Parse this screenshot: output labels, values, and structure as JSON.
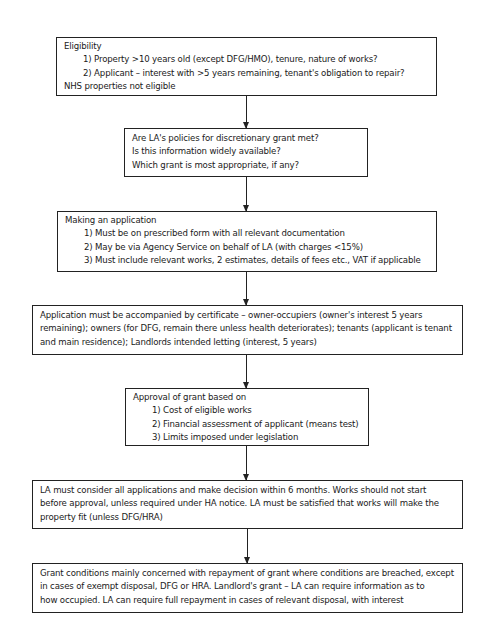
{
  "flowchart": {
    "boxes": [
      {
        "id": "eligibility",
        "title": "Eligibility",
        "items": [
          "1) Property >10 years old (except DFG/HMO), tenure, nature of works?",
          "2) Applicant – interest with >5 years remaining, tenant's obligation to repair?"
        ],
        "footer": "NHS properties not eligible"
      },
      {
        "id": "la-policies",
        "lines": [
          "Are LA's policies for discretionary grant met?",
          "Is this information widely available?",
          "Which grant is most appropriate, if any?"
        ]
      },
      {
        "id": "making-application",
        "title": "Making an application",
        "items": [
          "1) Must be on prescribed form with all relevant documentation",
          "2) May be via Agency Service on behalf of LA (with charges <15%)",
          "3)  Must include relevant works, 2 estimates, details of fees etc., VAT if applicable"
        ]
      },
      {
        "id": "certificate",
        "lines": [
          "Application must be accompanied by certificate – owner-occupiers (owner's interest 5 years",
          "remaining); owners (for DFG, remain there unless health deteriorates); tenants (applicant is tenant",
          "and main residence); Landlords intended letting (interest, 5 years)"
        ]
      },
      {
        "id": "approval",
        "title": "Approval of grant based on",
        "items": [
          "1) Cost of eligible works",
          "2) Financial assessment of applicant (means test)",
          "3) Limits imposed under legislation"
        ]
      },
      {
        "id": "decision",
        "lines": [
          "LA must consider all applications and make decision within 6 months. Works should not start",
          "before approval, unless required under HA notice. LA must be satisfied that works will make the",
          "property fit (unless DFG/HRA)"
        ]
      },
      {
        "id": "grant-conditions",
        "lines": [
          "Grant conditions mainly concerned with repayment of grant where conditions are breached, except",
          "in cases of exempt disposal, DFG or HRA. Landlord's grant – LA can require information as to",
          "how occupied. LA can require full repayment in cases of relevant disposal, with interest"
        ]
      }
    ],
    "colors": {
      "line": "#222222",
      "background": "#ffffff",
      "text": "#1a1a1a"
    }
  }
}
